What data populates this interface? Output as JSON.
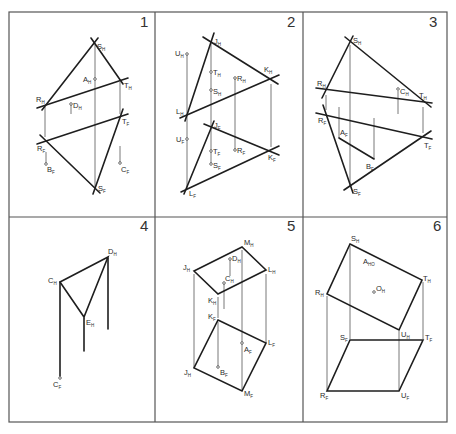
{
  "sheet": {
    "panel_count": 6,
    "stroke_color": "#1e1e1e",
    "frame_color": "#555555",
    "caption": ""
  },
  "panels": [
    {
      "number": "1",
      "labels": {
        "S_H": [
          "S",
          "H"
        ],
        "A_H": [
          "A",
          "H"
        ],
        "T_H": [
          "T",
          "H"
        ],
        "R_H": [
          "R",
          "H"
        ],
        "D_H": [
          "D",
          "H"
        ],
        "T_F": [
          "T",
          "F"
        ],
        "R_F": [
          "R",
          "F"
        ],
        "B_F": [
          "B",
          "F"
        ],
        "C_F": [
          "C",
          "F"
        ],
        "S_F": [
          "S",
          "F"
        ]
      }
    },
    {
      "number": "2",
      "labels": {
        "J_H": [
          "J",
          "H"
        ],
        "U_H": [
          "U",
          "H"
        ],
        "T_H": [
          "T",
          "H"
        ],
        "R_H": [
          "R",
          "H"
        ],
        "S_H": [
          "S",
          "H"
        ],
        "K_H": [
          "K",
          "H"
        ],
        "L_H": [
          "L",
          "H"
        ],
        "J_F": [
          "J",
          "F"
        ],
        "U_F": [
          "U",
          "F"
        ],
        "T_F": [
          "T",
          "F"
        ],
        "R_F": [
          "R",
          "F"
        ],
        "S_F": [
          "S",
          "F"
        ],
        "K_F": [
          "K",
          "F"
        ],
        "L_F": [
          "L",
          "F"
        ]
      }
    },
    {
      "number": "3",
      "labels": {
        "S_H": [
          "S",
          "H"
        ],
        "R_H": [
          "R",
          "H"
        ],
        "C_H": [
          "C",
          "H"
        ],
        "T_H": [
          "T",
          "H"
        ],
        "R_F": [
          "R",
          "F"
        ],
        "A_F": [
          "A",
          "F"
        ],
        "B_F": [
          "B",
          "F"
        ],
        "T_F": [
          "T",
          "F"
        ],
        "S_F": [
          "S",
          "F"
        ]
      }
    },
    {
      "number": "4",
      "labels": {
        "D_H": [
          "D",
          "H"
        ],
        "C_H": [
          "C",
          "H"
        ],
        "E_H": [
          "E",
          "H"
        ],
        "C_F": [
          "C",
          "F"
        ]
      }
    },
    {
      "number": "5",
      "labels": {
        "M_H": [
          "M",
          "H"
        ],
        "D_H": [
          "D",
          "H"
        ],
        "J_H": [
          "J",
          "H"
        ],
        "L_H": [
          "L",
          "H"
        ],
        "C_H": [
          "C",
          "H"
        ],
        "K_H": [
          "K",
          "H"
        ],
        "K_F": [
          "K",
          "F"
        ],
        "A_F": [
          "A",
          "F"
        ],
        "L_F": [
          "L",
          "F"
        ],
        "J_F": [
          "J",
          "H"
        ],
        "B_F": [
          "B",
          "F"
        ],
        "M_F": [
          "M",
          "F"
        ]
      }
    },
    {
      "number": "6",
      "labels": {
        "S_H": [
          "S",
          "H"
        ],
        "A_H": [
          "A",
          "HO"
        ],
        "O_H": [
          "O",
          "H"
        ],
        "T_H": [
          "T",
          "H"
        ],
        "R_H": [
          "R",
          "H"
        ],
        "U_H": [
          "U",
          "H"
        ],
        "S_F": [
          "S",
          "F"
        ],
        "T_F": [
          "T",
          "F"
        ],
        "R_F": [
          "R",
          "F"
        ],
        "U_F": [
          "U",
          "F"
        ]
      }
    }
  ]
}
